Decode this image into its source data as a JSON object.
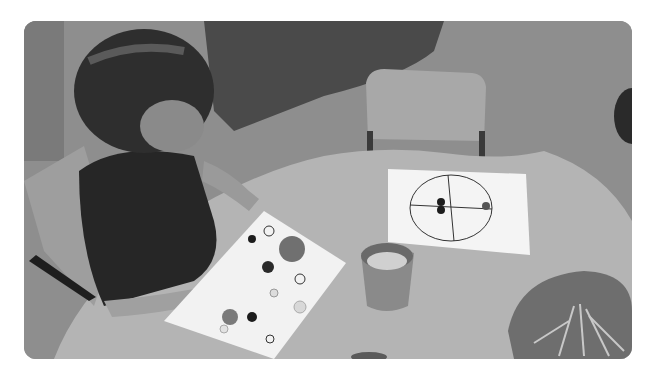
{
  "image": {
    "alt": "A young girl with a braided hairstyle sits at a wooden table, placing buttons onto a white board printed with circle outlines; nearby are a cup of buttons, a second board with a quartered circle, and a bowl of wooden pegs.",
    "tone": "grayscale",
    "frame": {
      "corner_radius_px": 12,
      "background": "#ffffff"
    },
    "colors": {
      "floor": "#8e8e8e",
      "rug": "#4a4a4a",
      "table": "#b4b4b4",
      "board": "#f2f2f2",
      "chair": "#a8a8a8",
      "dress": "#262626",
      "skin": "#9a9a9a",
      "hair": "#2e2e2e",
      "cup": "#8a8a8a",
      "bowl": "#6e6e6e"
    },
    "scene": {
      "subject": "child sorting buttons",
      "objects": [
        {
          "name": "button-matching-board",
          "description": "white board with printed circle outlines and buttons placed on it"
        },
        {
          "name": "quartered-circle-board",
          "description": "white board with a circle divided into four quadrants, a few buttons placed"
        },
        {
          "name": "button-cup",
          "description": "plastic cup filled with assorted buttons"
        },
        {
          "name": "peg-bowl",
          "description": "bowl holding wooden clothes pegs"
        },
        {
          "name": "empty-chair",
          "description": "small wooden chair across the table"
        },
        {
          "name": "rug",
          "description": "shaggy dark rug on the floor"
        }
      ]
    }
  }
}
